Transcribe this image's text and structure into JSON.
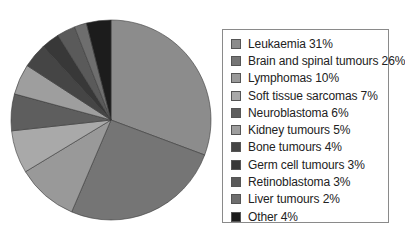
{
  "chart_data": {
    "type": "pie",
    "title": "",
    "legend_position": "right",
    "start_angle_deg": 0,
    "direction": "clockwise",
    "slices": [
      {
        "label": "Leukaemia",
        "value": 31,
        "color": "#8c8c8c"
      },
      {
        "label": "Brain and spinal tumours",
        "value": 26,
        "color": "#757575"
      },
      {
        "label": "Lymphomas",
        "value": 10,
        "color": "#999999"
      },
      {
        "label": "Soft tissue sarcomas",
        "value": 7,
        "color": "#a9a9a9"
      },
      {
        "label": "Neuroblastoma",
        "value": 6,
        "color": "#5e5e5e"
      },
      {
        "label": "Kidney tumours",
        "value": 5,
        "color": "#9e9e9e"
      },
      {
        "label": "Bone tumours",
        "value": 4,
        "color": "#454545"
      },
      {
        "label": "Germ cell tumours",
        "value": 3,
        "color": "#383838"
      },
      {
        "label": "Retinoblastoma",
        "value": 3,
        "color": "#5a5a5a"
      },
      {
        "label": "Liver tumours",
        "value": 2,
        "color": "#6e6e6e"
      },
      {
        "label": "Other",
        "value": 4,
        "color": "#1c1c1c"
      }
    ]
  },
  "legend": {
    "items": [
      {
        "text": "Leukaemia 31%"
      },
      {
        "text": "Brain and spinal tumours 26%"
      },
      {
        "text": "Lymphomas 10%"
      },
      {
        "text": "Soft tissue sarcomas 7%"
      },
      {
        "text": "Neuroblastoma 6%"
      },
      {
        "text": "Kidney tumours 5%"
      },
      {
        "text": "Bone tumours 4%"
      },
      {
        "text": "Germ cell tumours 3%"
      },
      {
        "text": "Retinoblastoma 3%"
      },
      {
        "text": "Liver tumours 2%"
      },
      {
        "text": "Other 4%"
      }
    ]
  }
}
